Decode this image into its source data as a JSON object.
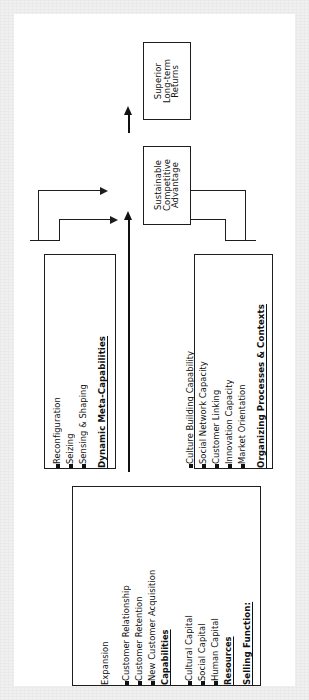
{
  "figure": {
    "orientation": "rotated-90",
    "background_color": "#ffffff",
    "border_color": "#f0f0f0",
    "line_color": "#1d1d1d"
  },
  "nodes": {
    "returns": {
      "name": "Superior Long-term Returns",
      "lines": [
        "Superior",
        "Long-term",
        "Returns"
      ]
    },
    "sca": {
      "name": "Sustainable Competitive Advantage",
      "lines": [
        "Sustainable",
        "Competitive",
        "Advantage"
      ]
    },
    "dynamic_meta_capabilities": {
      "header": "Dynamic Meta-Capabilities",
      "items": [
        "Sensing & Shaping",
        "Seizing",
        "Reconfiguration"
      ]
    },
    "organizing_processes": {
      "header": "Organizing Processes & Contexts",
      "items": [
        "Market Orientation",
        "Innovation Capacity",
        "Customer Linking",
        "Social Network Capacity",
        "Culture Building Capability"
      ]
    },
    "selling_function": {
      "header": "Selling Function:",
      "groups": [
        {
          "label": "Resources",
          "items": [
            "Human Capital",
            "Social Capital",
            "Cultural Capital"
          ]
        },
        {
          "label": "Capabilities",
          "items": [
            "New Customer Acquisition",
            "Customer Retention",
            "Customer Relationship",
            "Expansion"
          ]
        }
      ]
    }
  },
  "connectors": [
    {
      "name": "sca-to-returns",
      "from": "sca",
      "to": "returns",
      "style": "thick-arrow"
    },
    {
      "name": "selling-to-sca",
      "from": "selling_function",
      "to": "sca",
      "style": "thick-arrow"
    },
    {
      "name": "dmc-upper-elbow",
      "from": "dynamic_meta_capabilities",
      "to": "sca",
      "style": "elbow-arrow"
    },
    {
      "name": "dmc-lower-elbow",
      "from": "dynamic_meta_capabilities",
      "to": "sca",
      "style": "elbow-arrow"
    },
    {
      "name": "opc-upper-elbow",
      "from": "organizing_processes",
      "to": "sca",
      "style": "elbow-arrow"
    },
    {
      "name": "opc-lower-elbow",
      "from": "organizing_processes",
      "to": "sca",
      "style": "elbow-arrow"
    }
  ]
}
